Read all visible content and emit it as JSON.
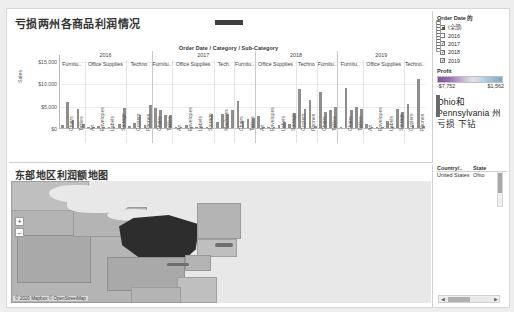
{
  "chart_pane": {
    "title": "亏损两州各商品利润情况",
    "hierarchy_header": "Order Date  /  Category  /  Sub-Category",
    "ylabel": "Sales",
    "yticks": [
      "$15,000",
      "$10,000",
      "$5,000",
      "$0"
    ]
  },
  "map_pane": {
    "title": "东部地区利润额地图",
    "attribution": "© 2020 Mapbox © OpenStreetMap",
    "zoom_in": "+",
    "zoom_out": "–"
  },
  "side": {
    "filter": {
      "title": "Order Date 的",
      "items": [
        {
          "label": "(全部)",
          "state": "partial"
        },
        {
          "label": "2016",
          "state": "off"
        },
        {
          "label": "2017",
          "state": "on"
        },
        {
          "label": "2018",
          "state": "on"
        },
        {
          "label": "2019",
          "state": "on"
        }
      ]
    },
    "profit_legend": {
      "title": "Profit",
      "min": "-$7,752",
      "max": "$1,562",
      "low_color": "#7f4f9e",
      "high_color": "#7fa8c8"
    },
    "note": "Ohio和 Pennsylvania 州亏损 下钻",
    "table": {
      "columns": [
        "Country/..",
        "State"
      ],
      "rows": [
        [
          "United States",
          "Ohio"
        ]
      ]
    }
  },
  "chart_data": {
    "type": "bar",
    "title": "亏损两州各商品利润情况",
    "xlabel": "Order Date / Category / Sub-Category",
    "ylabel": "Sales",
    "ylim": [
      0,
      16500
    ],
    "yticks": [
      0,
      5000,
      10000,
      15000
    ],
    "grid": true,
    "legend": "none",
    "groups": [
      {
        "year": "2016",
        "categories": [
          {
            "name": "Furnitu..",
            "display": "Furnitu..",
            "subcategories": [
              {
                "label": "",
                "value": 700
              },
              {
                "label": "Chairs",
                "value": 5700
              },
              {
                "label": "",
                "value": 1700
              },
              {
                "label": "Tables",
                "value": 4300
              },
              {
                "label": "",
                "value": 950
              }
            ]
          },
          {
            "name": "Office Supplies",
            "display": "Office Supplies",
            "subcategories": [
              {
                "label": "Art",
                "value": 320
              },
              {
                "label": "",
                "value": 300
              },
              {
                "label": "Envelopes",
                "value": 430
              },
              {
                "label": "",
                "value": 60
              },
              {
                "label": "Labels",
                "value": 80
              },
              {
                "label": "",
                "value": 120
              },
              {
                "label": "Storage",
                "value": 900
              },
              {
                "label": "",
                "value": 4500
              }
            ]
          },
          {
            "name": "Techno..",
            "display": "Techno",
            "subcategories": [
              {
                "label": "",
                "value": 350
              },
              {
                "label": "Copiers",
                "value": 1100
              },
              {
                "label": "",
                "value": 3000
              },
              {
                "label": "Phones",
                "value": 650
              },
              {
                "label": "",
                "value": 5200
              }
            ]
          }
        ]
      },
      {
        "year": "2017",
        "categories": [
          {
            "name": "Furnitu..",
            "display": "Furnitu..",
            "subcategories": [
              {
                "label": "Chairs",
                "value": 4500
              },
              {
                "label": "",
                "value": 4000
              },
              {
                "label": "Tables",
                "value": 3000
              },
              {
                "label": "",
                "value": 2800
              }
            ]
          },
          {
            "name": "Office Supplies",
            "display": "Office Supplies",
            "subcategories": [
              {
                "label": "Art",
                "value": 280
              },
              {
                "label": "",
                "value": 250
              },
              {
                "label": "Envelopes",
                "value": 600
              },
              {
                "label": "",
                "value": 80
              },
              {
                "label": "Labels",
                "value": 70
              },
              {
                "label": "",
                "value": 150
              },
              {
                "label": "Storage",
                "value": 330
              },
              {
                "label": "",
                "value": 3100
              }
            ]
          },
          {
            "name": "Tech..",
            "display": "Tech.",
            "subcategories": [
              {
                "label": "",
                "value": 1300
              },
              {
                "label": "Machines",
                "value": 3100
              },
              {
                "label": "",
                "value": 3200
              },
              {
                "label": "",
                "value": 4100
              }
            ]
          },
          {
            "name": "Furnitu..",
            "display": "Furnitu..",
            "subcategories": [
              {
                "label": "Chairs",
                "value": 6000
              },
              {
                "label": "",
                "value": 1500
              },
              {
                "label": "Tables",
                "value": 2000
              },
              {
                "label": "",
                "value": 2300
              }
            ]
          }
        ]
      },
      {
        "year": "2018",
        "categories": [
          {
            "name": "Office Supplies",
            "display": "Office Supplies",
            "subcategories": [
              {
                "label": "Art",
                "value": 2600
              },
              {
                "label": "",
                "value": 250
              },
              {
                "label": "Envelopes",
                "value": 200
              },
              {
                "label": "",
                "value": 120
              },
              {
                "label": "Labels",
                "value": 700
              },
              {
                "label": "",
                "value": 1300
              },
              {
                "label": "Storage",
                "value": 900
              },
              {
                "label": "",
                "value": 3300
              }
            ]
          },
          {
            "name": "Techno..",
            "display": "Techno",
            "subcategories": [
              {
                "label": "Copiers",
                "value": 8800
              },
              {
                "label": "",
                "value": 4300
              },
              {
                "label": "Phones",
                "value": 6200
              },
              {
                "label": "",
                "value": 500
              }
            ]
          },
          {
            "name": "Furnitu..",
            "display": "Furnitu..",
            "subcategories": [
              {
                "label": "Chairs",
                "value": 8000
              },
              {
                "label": "",
                "value": 3500
              },
              {
                "label": "Tables",
                "value": 4000
              },
              {
                "label": "",
                "value": 4600
              }
            ]
          }
        ]
      },
      {
        "year": "2019",
        "categories": [
          {
            "name": "Furnitu..",
            "display": "Furnitu..",
            "subcategories": [
              {
                "label": "",
                "value": 300
              },
              {
                "label": "Chairs",
                "value": 9000
              },
              {
                "label": "",
                "value": 4000
              },
              {
                "label": "Tables",
                "value": 4700
              },
              {
                "label": "",
                "value": 4200
              }
            ]
          },
          {
            "name": "Office Supplies",
            "display": "Office Supplies",
            "subcategories": [
              {
                "label": "Art",
                "value": 900
              },
              {
                "label": "",
                "value": 200
              },
              {
                "label": "Envelopes",
                "value": 150
              },
              {
                "label": "",
                "value": 90
              },
              {
                "label": "Labels",
                "value": 1500
              },
              {
                "label": "",
                "value": 300
              },
              {
                "label": "Storage",
                "value": 4200
              },
              {
                "label": "",
                "value": 3600
              }
            ]
          },
          {
            "name": "Techno..",
            "display": "Techno..",
            "subcategories": [
              {
                "label": "Copiers",
                "value": 5400
              },
              {
                "label": "",
                "value": 700
              },
              {
                "label": "Phones",
                "value": 11000
              },
              {
                "label": "",
                "value": 400
              }
            ]
          }
        ]
      }
    ]
  }
}
